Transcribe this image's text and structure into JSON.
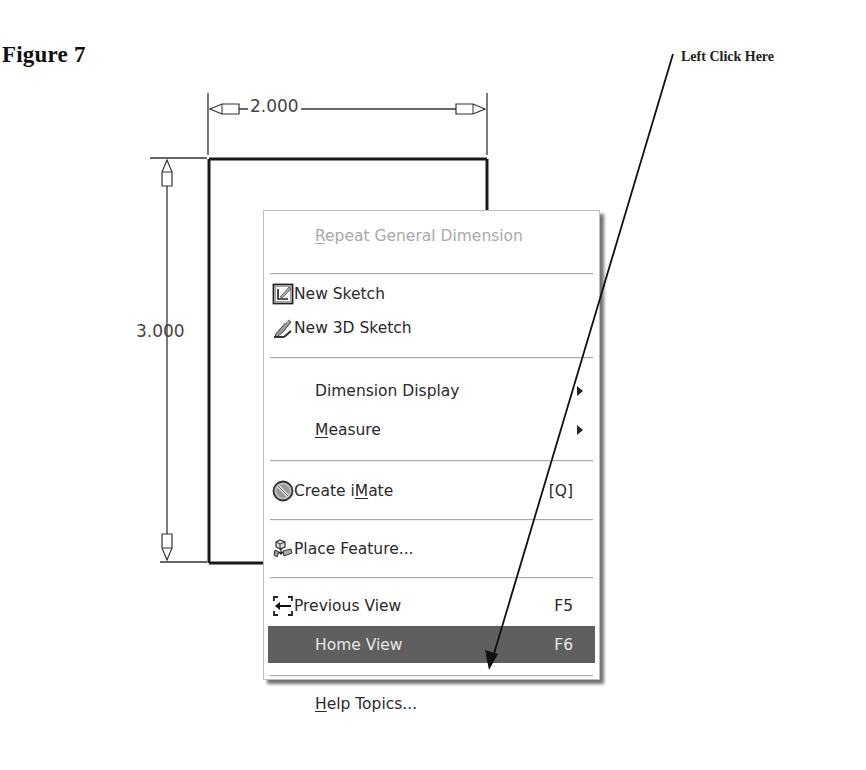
{
  "figure": {
    "label": "Figure 7",
    "callout_text": "Left Click Here"
  },
  "sketch": {
    "width_dimension": "2.000",
    "height_dimension": "3.000"
  },
  "context_menu": {
    "items": [
      {
        "id": "repeat-general-dimension",
        "label_prefix": "",
        "label_underline": "R",
        "label_suffix": "epeat General Dimension",
        "state": "disabled"
      },
      {
        "id": "new-sketch",
        "label": "New Sketch",
        "icon": "new-sketch-icon"
      },
      {
        "id": "new-3d-sketch",
        "label": "New 3D Sketch",
        "icon": "new-3d-sketch-icon"
      },
      {
        "id": "dimension-display",
        "label": "Dimension Display",
        "has_submenu": true
      },
      {
        "id": "measure",
        "label_prefix": "",
        "label_underline": "M",
        "label_suffix": "easure",
        "has_submenu": true
      },
      {
        "id": "create-imate",
        "label_prefix": "Create i",
        "label_underline": "M",
        "label_suffix": "ate",
        "shortcut": "[Q]",
        "icon": "create-imate-icon"
      },
      {
        "id": "place-feature",
        "label": "Place Feature...",
        "icon": "place-feature-icon"
      },
      {
        "id": "previous-view",
        "label": "Previous View",
        "shortcut": "F5",
        "icon": "previous-view-icon"
      },
      {
        "id": "home-view",
        "label": "Home View",
        "shortcut": "F6",
        "state": "highlighted"
      },
      {
        "id": "help-topics",
        "label_prefix": "",
        "label_underline": "H",
        "label_suffix": "elp Topics...",
        "state": "normal"
      }
    ]
  },
  "colors": {
    "highlight_bg": "#5f5f5f",
    "disabled_text": "#a9a9a9",
    "menu_border": "#bdbdbd"
  }
}
